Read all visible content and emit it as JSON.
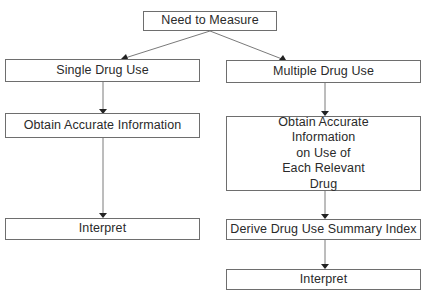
{
  "diagram": {
    "root": {
      "label": "Need to Measure"
    },
    "left_branch": {
      "steps": [
        {
          "label": "Single Drug Use"
        },
        {
          "label": "Obtain Accurate Information"
        },
        {
          "label": "Interpret"
        }
      ]
    },
    "right_branch": {
      "steps": [
        {
          "label": "Multiple Drug Use"
        },
        {
          "label": "Obtain Accurate\nInformation\non Use of\nEach Relevant\nDrug"
        },
        {
          "label": "Derive Drug Use Summary Index"
        },
        {
          "label": "Interpret"
        }
      ]
    },
    "colors": {
      "line": "#6e6e6e",
      "arrow": "#222222",
      "border": "#6e6e6e"
    }
  }
}
